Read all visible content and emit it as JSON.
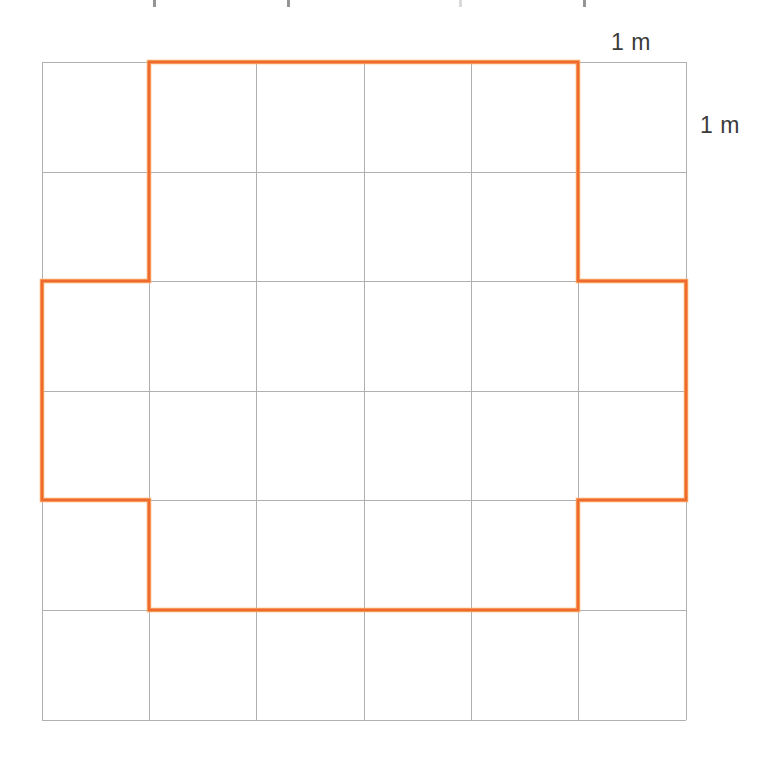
{
  "figure": {
    "background_color": "#ffffff",
    "grid": {
      "columns": 6,
      "rows": 6,
      "cell_size_label": "1 m",
      "line_color": "#b0b0b0",
      "line_width_px": 1,
      "origin_x_px": 42,
      "origin_y_px": 62,
      "cell_width_px": 107.33,
      "cell_height_px": 109.67,
      "x_gridlines_px": [
        42,
        149,
        256,
        364,
        471,
        578,
        686
      ],
      "y_gridlines_px": [
        62,
        172,
        281,
        391,
        500,
        610,
        720
      ]
    },
    "shape": {
      "name": "cross-polygon",
      "stroke_color": "#ee6a30",
      "stroke_highlight_color": "#f8a960",
      "stroke_width_px": 2.5,
      "fill": "none",
      "vertices_grid": [
        [
          1,
          0
        ],
        [
          5,
          0
        ],
        [
          5,
          2
        ],
        [
          6,
          2
        ],
        [
          6,
          4
        ],
        [
          5,
          4
        ],
        [
          5,
          5
        ],
        [
          1,
          5
        ],
        [
          1,
          4
        ],
        [
          0,
          4
        ],
        [
          0,
          2
        ],
        [
          1,
          2
        ]
      ],
      "vertices_px": [
        [
          149,
          62
        ],
        [
          578,
          62
        ],
        [
          578,
          281
        ],
        [
          686,
          281
        ],
        [
          686,
          500
        ],
        [
          578,
          500
        ],
        [
          578,
          610
        ],
        [
          149,
          610
        ],
        [
          149,
          500
        ],
        [
          42,
          500
        ],
        [
          42,
          281
        ],
        [
          149,
          281
        ]
      ],
      "area_squares": 24,
      "perimeter_units": 20
    },
    "labels": {
      "top_unit": "1 m",
      "right_unit": "1 m",
      "text_color": "#3b3b3b"
    },
    "artifacts": {
      "top_ink_marks_x_px": [
        153,
        287,
        459,
        583
      ]
    }
  }
}
